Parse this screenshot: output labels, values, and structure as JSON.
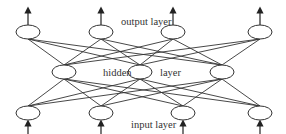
{
  "diagram": {
    "labels": {
      "output": "output layer",
      "hidden_left": "hidden",
      "hidden_right": "layer",
      "input": "input layer"
    },
    "layers": {
      "output": [
        {
          "x": 28,
          "y": 32
        },
        {
          "x": 101,
          "y": 32
        },
        {
          "x": 173,
          "y": 32
        },
        {
          "x": 260,
          "y": 32
        }
      ],
      "hidden": [
        {
          "x": 64,
          "y": 72
        },
        {
          "x": 140,
          "y": 72
        },
        {
          "x": 222,
          "y": 72
        }
      ],
      "input": [
        {
          "x": 28,
          "y": 113
        },
        {
          "x": 101,
          "y": 113
        },
        {
          "x": 183,
          "y": 113
        },
        {
          "x": 260,
          "y": 113
        }
      ]
    },
    "node_rx": 12,
    "node_ry": 7,
    "colors": {
      "stroke": "#333333",
      "background": "#ffffff"
    }
  }
}
